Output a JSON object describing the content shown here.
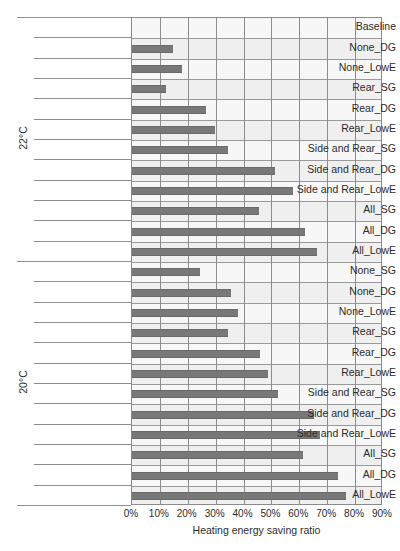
{
  "chart_data": {
    "type": "bar",
    "orientation": "horizontal",
    "title": "",
    "xlabel": "Heating energy saving ratio",
    "ylabel": "",
    "xlim": [
      0,
      90
    ],
    "xtick_labels": [
      "0%",
      "10%",
      "20%",
      "30%",
      "40%",
      "50%",
      "60%",
      "70%",
      "80%",
      "90%"
    ],
    "xtick_values": [
      0,
      10,
      20,
      30,
      40,
      50,
      60,
      70,
      80,
      90
    ],
    "grid": true,
    "legend": "none",
    "bar_color": "#787878",
    "plot_background": "#efefef",
    "group_axis_label": "Indoor set-point temperature",
    "groups": [
      {
        "label": "22°C",
        "categories": [
          "Baseline",
          "None_DG",
          "None_LowE",
          "Rear_SG",
          "Rear_DG",
          "Rear_LowE",
          "Side and Rear_SG",
          "Side and Rear_DG",
          "Side and Rear_LowE",
          "All_SG",
          "All_DG",
          "All_LowE"
        ],
        "values": [
          0,
          14.8,
          18.0,
          12.1,
          26.6,
          29.8,
          34.3,
          51.2,
          57.8,
          45.4,
          62.0,
          66.4
        ]
      },
      {
        "label": "20°C",
        "categories": [
          "None_SG",
          "None_DG",
          "None_LowE",
          "Rear_SG",
          "Rear_DG",
          "Rear_LowE",
          "Side and Rear_SG",
          "Side and Rear_DG",
          "Side and Rear_LowE",
          "All_SG",
          "All_DG",
          "All_LowE"
        ],
        "values": [
          24.4,
          35.6,
          38.1,
          34.4,
          45.8,
          48.6,
          52.3,
          65.4,
          67.3,
          61.2,
          74.0,
          76.6
        ]
      }
    ]
  },
  "footnote": ""
}
